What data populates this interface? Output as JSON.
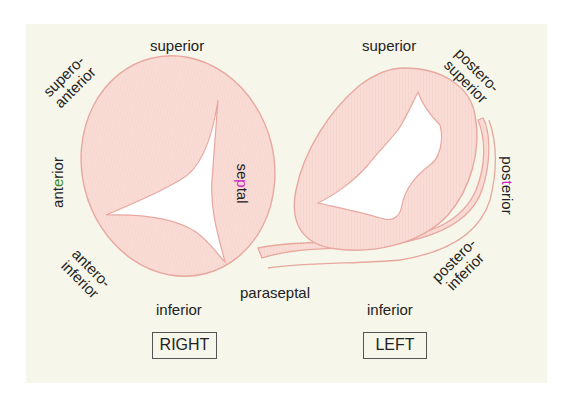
{
  "diagram": {
    "title": "",
    "colors": {
      "background": "#f7f6ea",
      "annulus_fill": "#f9d8d2",
      "annulus_stroke": "#e8a8a0",
      "orifice": "#ffffff",
      "text": "#222222",
      "highlight_anterior": "#3a8a1e",
      "highlight_septal": "#d020c0",
      "highlight_posterior": "#d020c0"
    },
    "right_valve": {
      "label": "RIGHT",
      "labels": {
        "superior": "superior",
        "supero_anterior_1": "supero-",
        "supero_anterior_2": "anterior",
        "anterior_pre": "an",
        "anterior_hl": "t",
        "anterior_e": "e",
        "anterior_post": "rior",
        "septal_pre": "se",
        "septal_hl": "p",
        "septal_post": "tal",
        "antero_inferior_1": "antero-",
        "antero_inferior_2": "inferior",
        "inferior": "inferior"
      }
    },
    "left_valve": {
      "label": "LEFT",
      "labels": {
        "superior": "superior",
        "postero_superior_1": "postero-",
        "postero_superior_2": "superior",
        "posterior_pre": "pos",
        "posterior_hl": "t",
        "posterior_post": "erior",
        "postero_inferior_1": "postero-",
        "postero_inferior_2": "inferior",
        "inferior": "inferior"
      }
    },
    "center": {
      "paraseptal": "paraseptal"
    }
  }
}
